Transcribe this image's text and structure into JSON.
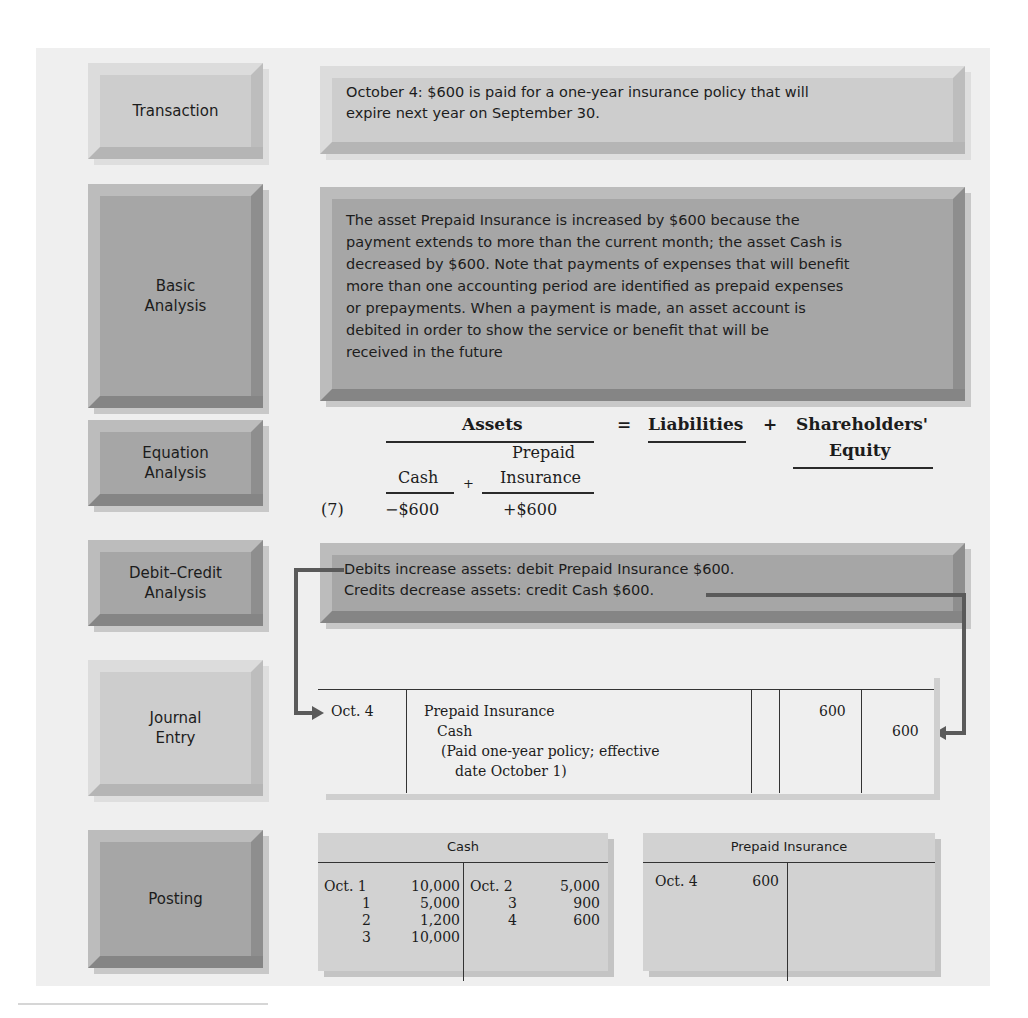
{
  "rows": {
    "transaction": {
      "label": "Transaction",
      "text_line1": "October 4: $600 is paid for a one-year insurance policy that will",
      "text_line2": "expire next year on September 30."
    },
    "basic_analysis": {
      "label_line1": "Basic",
      "label_line2": "Analysis",
      "lines": [
        "The asset Prepaid Insurance is increased by $600 because the",
        "payment extends to more than the current month; the asset Cash is",
        "decreased by $600. Note that payments of expenses that will benefit",
        "more than one accounting period are identified as prepaid expenses",
        "or prepayments. When a payment is made, an asset account is",
        "debited in order to show the service or benefit that will be",
        "received in the future"
      ]
    },
    "equation_analysis": {
      "label_line1": "Equation",
      "label_line2": "Analysis",
      "assets": "Assets",
      "equals": "=",
      "liabilities": "Liabilities",
      "plus": "+",
      "equity_line1": "Shareholders'",
      "equity_line2": "Equity",
      "col_cash": "Cash",
      "col_plus": "+",
      "col_prepaid_line1": "Prepaid",
      "col_prepaid_line2": "Insurance",
      "entry_no": "(7)",
      "cash_change": "−$600",
      "prepaid_change": "+$600"
    },
    "debit_credit": {
      "label_line1": "Debit–Credit",
      "label_line2": "Analysis",
      "line1": "Debits increase assets: debit Prepaid Insurance $600.",
      "line2": "Credits decrease assets: credit Cash $600."
    },
    "journal_entry": {
      "label_line1": "Journal",
      "label_line2": "Entry",
      "date": "Oct. 4",
      "debit_account": "Prepaid Insurance",
      "credit_account": "Cash",
      "explanation_line1": "(Paid one-year policy; effective",
      "explanation_line2": "date October 1)",
      "debit_amount": "600",
      "credit_amount": "600"
    },
    "posting": {
      "label": "Posting",
      "cash_account": {
        "title": "Cash",
        "debits": [
          {
            "date": "Oct. 1",
            "amount": "10,000"
          },
          {
            "date": "1",
            "amount": "5,000"
          },
          {
            "date": "2",
            "amount": "1,200"
          },
          {
            "date": "3",
            "amount": "10,000"
          }
        ],
        "credits": [
          {
            "date": "Oct. 2",
            "amount": "5,000"
          },
          {
            "date": "3",
            "amount": "900"
          },
          {
            "date": "4",
            "amount": "600"
          }
        ]
      },
      "prepaid_account": {
        "title": "Prepaid Insurance",
        "debits": [
          {
            "date": "Oct. 4",
            "amount": "600"
          }
        ],
        "credits": []
      }
    }
  },
  "colors": {
    "panel_bg": "#efefef",
    "light_box": "#cdcdcd",
    "dark_box": "#a6a6a6",
    "arrow": "#5a5a5a"
  }
}
